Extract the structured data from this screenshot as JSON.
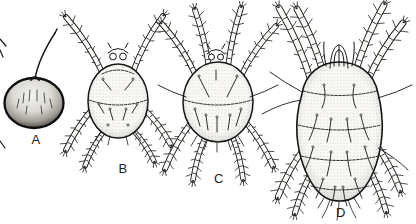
{
  "illustration": {
    "description_labels": [
      "A",
      "B",
      "C",
      "D"
    ],
    "panels": [
      {
        "id": "egg",
        "label": "A"
      },
      {
        "id": "larva",
        "label": "B"
      },
      {
        "id": "nymph",
        "label": "C"
      },
      {
        "id": "adult",
        "label": "D"
      }
    ]
  },
  "colors": {
    "ink": "#161616",
    "paper": "#ffffff"
  }
}
